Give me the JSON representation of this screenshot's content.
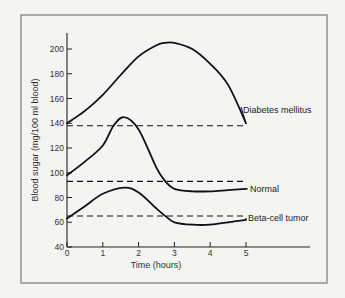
{
  "chart_data": {
    "type": "line",
    "title": "",
    "xlabel": "Time (hours)",
    "ylabel": "Blood sugar (mg/100 ml blood)",
    "xlim": [
      0,
      5
    ],
    "ylim": [
      40,
      210
    ],
    "xticks": [
      0,
      1,
      2,
      3,
      4,
      5
    ],
    "xtick_labels": [
      "0",
      "1",
      "2",
      "3",
      "4",
      "5"
    ],
    "yticks": [
      40,
      60,
      80,
      100,
      120,
      140,
      160,
      180,
      200
    ],
    "ytick_labels": [
      "40",
      "60",
      "80",
      "100",
      "120",
      "140",
      "160",
      "180",
      "200"
    ],
    "grid": false,
    "legend": "inline labels at right end of curves",
    "series": [
      {
        "name": "Diabetes mellitus",
        "style": "solid",
        "x": [
          0,
          0.5,
          1,
          1.5,
          2,
          2.5,
          2.75,
          3,
          3.5,
          4,
          4.5,
          5
        ],
        "values": [
          140,
          150,
          163,
          179,
          194,
          203,
          205,
          205,
          200,
          188,
          171,
          140
        ]
      },
      {
        "name": "Diabetes mellitus baseline",
        "style": "dashed",
        "x": [
          0,
          5
        ],
        "values": [
          138,
          138
        ]
      },
      {
        "name": "Normal",
        "style": "solid",
        "x": [
          0,
          0.5,
          1,
          1.3,
          1.6,
          2,
          2.5,
          2.75,
          3,
          3.5,
          4,
          4.5,
          5
        ],
        "values": [
          98,
          109,
          122,
          138,
          145,
          135,
          104,
          93,
          87,
          85,
          85,
          86,
          87
        ]
      },
      {
        "name": "Normal baseline",
        "style": "dashed",
        "x": [
          0,
          5
        ],
        "values": [
          93,
          93
        ]
      },
      {
        "name": "Beta-cell tumor",
        "style": "solid",
        "x": [
          0,
          0.5,
          1,
          1.6,
          2,
          2.5,
          2.75,
          3,
          3.5,
          4,
          4.5,
          5
        ],
        "values": [
          63,
          73,
          83,
          88,
          84,
          71,
          65,
          60,
          58,
          58,
          60,
          62
        ]
      },
      {
        "name": "Beta-cell tumor baseline",
        "style": "dashed",
        "x": [
          0,
          5
        ],
        "values": [
          65,
          65
        ]
      }
    ],
    "annotations": [
      "Diabetes mellitus",
      "Normal",
      "Beta-cell tumor"
    ]
  },
  "labels": {
    "xlabel": "Time (hours)",
    "ylabel": "Blood sugar (mg/100 ml blood)",
    "diabetes": "Diabetes mellitus",
    "normal": "Normal",
    "beta": "Beta-cell tumor"
  },
  "colors": {
    "line": "#111111",
    "frame": "#777777",
    "background": "#f4f4f2"
  }
}
